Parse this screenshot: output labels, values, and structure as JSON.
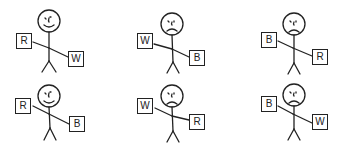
{
  "figures": [
    {
      "row": 1,
      "col": 1,
      "expression": "happy",
      "left_card": "R",
      "right_card": "W"
    },
    {
      "row": 1,
      "col": 2,
      "expression": "sad",
      "left_card": "W",
      "right_card": "B"
    },
    {
      "row": 1,
      "col": 3,
      "expression": "sad",
      "left_card": "B",
      "right_card": "R"
    },
    {
      "row": 2,
      "col": 1,
      "expression": "happy",
      "left_card": "R",
      "right_card": "B"
    },
    {
      "row": 2,
      "col": 2,
      "expression": "sad",
      "left_card": "W",
      "right_card": "R"
    },
    {
      "row": 2,
      "col": 3,
      "expression": "sad",
      "left_card": "B",
      "right_card": "W"
    }
  ],
  "colors": {
    "ink": "#222222",
    "background": "#ffffff"
  }
}
